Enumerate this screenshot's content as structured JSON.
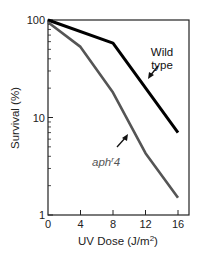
{
  "chart_data": {
    "type": "line",
    "title": "",
    "xlabel": "UV Dose (J/m",
    "xlabel_sup": "2",
    "xlabel_tail": ")",
    "ylabel": "Survival (%)",
    "xlim": [
      0,
      17
    ],
    "ylim": [
      1,
      100
    ],
    "yscale": "log",
    "x_ticks": [
      0,
      4,
      8,
      12,
      16
    ],
    "x_tick_labels": [
      "0",
      "4",
      "8",
      "12",
      "16"
    ],
    "y_ticks": [
      1,
      10,
      100
    ],
    "y_tick_labels": [
      "1",
      "10",
      "100"
    ],
    "grid": false,
    "legend": "none (inline annotations)",
    "series": [
      {
        "name": "Wild type",
        "color": "#000000",
        "x": [
          0,
          8,
          16
        ],
        "values": [
          100,
          58,
          7
        ]
      },
      {
        "name": "aph r4",
        "color": "#555555",
        "x": [
          0,
          4,
          8,
          12,
          16
        ],
        "values": [
          95,
          53,
          18,
          4.3,
          1.5
        ]
      }
    ],
    "annotations": [
      {
        "text_line1": "Wild",
        "text_line2": "type",
        "target_series": "Wild type",
        "arrow": true
      },
      {
        "text_main": "aph",
        "text_sup": "r",
        "text_tail": "4",
        "target_series": "aph r4",
        "arrow": true
      }
    ]
  }
}
